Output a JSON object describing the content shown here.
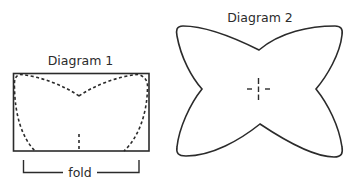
{
  "diagram1": {
    "title": "Diagram 1",
    "fold_label": "fold"
  },
  "diagram2": {
    "title": "Diagram 2"
  },
  "colors": {
    "stroke": "#2b2b2b",
    "background": "#ffffff"
  }
}
